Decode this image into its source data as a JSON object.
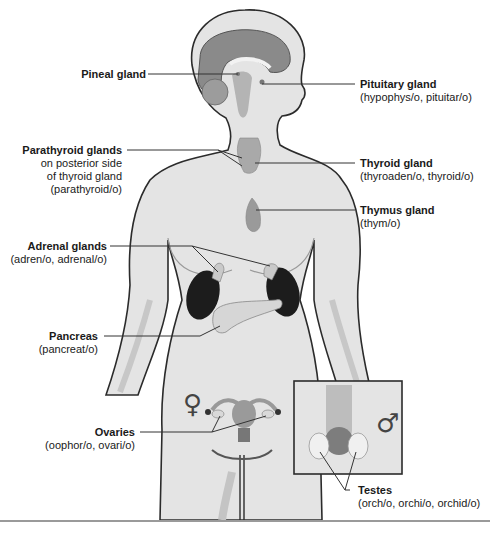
{
  "diagram": {
    "type": "anatomical-illustration",
    "colors": {
      "skin": "#e4e4e4",
      "skin_shadow": "#cfcfcf",
      "outline": "#2b2b2b",
      "brain": "#8a8a8a",
      "gland": "#a9a9a9",
      "kidney": "#1c1c1c",
      "leader_line": "#333333",
      "rule": "#9a9a9a"
    }
  },
  "labels": {
    "pineal": {
      "title": "Pineal gland"
    },
    "pituitary": {
      "title": "Pituitary gland",
      "sub": "(hypophys/o, pituitar/o)"
    },
    "parathyroid": {
      "title": "Parathyroid glands",
      "sub1": "on posterior side",
      "sub2": "of thyroid gland",
      "sub3": "(parathyroid/o)"
    },
    "thyroid": {
      "title": "Thyroid gland",
      "sub": "(thyroaden/o, thyroid/o)"
    },
    "thymus": {
      "title": "Thymus gland",
      "sub": "(thym/o)"
    },
    "adrenal": {
      "title": "Adrenal glands",
      "sub": "(adren/o, adrenal/o)"
    },
    "pancreas": {
      "title": "Pancreas",
      "sub": "(pancreat/o)"
    },
    "ovaries": {
      "title": "Ovaries",
      "sub": "(oophor/o, ovari/o)"
    },
    "testes": {
      "title": "Testes",
      "sub": "(orch/o, orchi/o, orchid/o)"
    }
  },
  "symbols": {
    "female": "♀",
    "male": "♂"
  }
}
